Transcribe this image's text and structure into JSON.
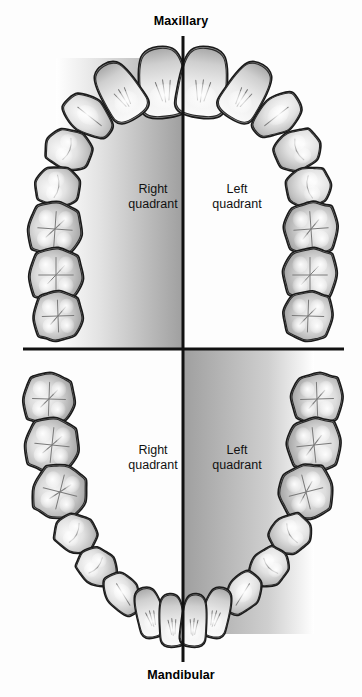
{
  "figure": {
    "background_color": "#fdfdfd",
    "axis_line_color": "#111111",
    "shading_color": "#a8a8a8"
  },
  "labels": {
    "maxillary": "Maxillary",
    "mandibular": "Mandibular",
    "upper_right": "Right\nquadrant",
    "upper_left": "Left\nquadrant",
    "lower_right": "Right\nquadrant",
    "lower_left": "Left\nquadrant",
    "quadrant_word_right": "Right",
    "quadrant_word_left": "Left",
    "quadrant_word_quadrant": "quadrant"
  },
  "quadrants": [
    {
      "id": "upper-right",
      "arch": "maxillary",
      "side": "right",
      "shaded": true,
      "label_line1": "Right",
      "label_line2": "quadrant"
    },
    {
      "id": "upper-left",
      "arch": "maxillary",
      "side": "left",
      "shaded": false,
      "label_line1": "Left",
      "label_line2": "quadrant"
    },
    {
      "id": "lower-right",
      "arch": "mandibular",
      "side": "right",
      "shaded": false,
      "label_line1": "Right",
      "label_line2": "quadrant"
    },
    {
      "id": "lower-left",
      "arch": "mandibular",
      "side": "left",
      "shaded": true,
      "label_line1": "Left",
      "label_line2": "quadrant"
    }
  ],
  "axes": {
    "vertical_line": {
      "x": 183,
      "y1": 36,
      "y2": 662,
      "width": 3
    },
    "horizontal_line": {
      "y": 349,
      "x1": 23,
      "x2": 344,
      "width": 3
    }
  },
  "teeth": {
    "maxillary_right": [
      {
        "name": "central-incisor",
        "cx": 163,
        "cy": 83,
        "rx": 25,
        "ry": 32,
        "rot": -8,
        "type": "incisor"
      },
      {
        "name": "lateral-incisor",
        "cx": 120,
        "cy": 92,
        "rx": 20,
        "ry": 28,
        "rot": -32,
        "type": "incisor"
      },
      {
        "name": "canine",
        "cx": 89,
        "cy": 116,
        "rx": 19,
        "ry": 26,
        "rot": -52,
        "type": "canine"
      },
      {
        "name": "first-premolar",
        "cx": 69,
        "cy": 150,
        "rx": 20,
        "ry": 22,
        "rot": -68,
        "type": "premolar"
      },
      {
        "name": "second-premolar",
        "cx": 58,
        "cy": 187,
        "rx": 20,
        "ry": 21,
        "rot": -80,
        "type": "premolar"
      },
      {
        "name": "first-molar",
        "cx": 55,
        "cy": 229,
        "rx": 25,
        "ry": 24,
        "rot": -86,
        "type": "molar"
      },
      {
        "name": "second-molar",
        "cx": 56,
        "cy": 275,
        "rx": 25,
        "ry": 24,
        "rot": -90,
        "type": "molar"
      },
      {
        "name": "third-molar",
        "cx": 58,
        "cy": 316,
        "rx": 23,
        "ry": 22,
        "rot": -92,
        "type": "molar"
      }
    ],
    "maxillary_left": [
      {
        "name": "central-incisor",
        "cx": 203,
        "cy": 83,
        "rx": 25,
        "ry": 32,
        "rot": 8,
        "type": "incisor"
      },
      {
        "name": "lateral-incisor",
        "cx": 246,
        "cy": 92,
        "rx": 20,
        "ry": 28,
        "rot": 32,
        "type": "incisor"
      },
      {
        "name": "canine",
        "cx": 277,
        "cy": 116,
        "rx": 19,
        "ry": 26,
        "rot": 52,
        "type": "canine"
      },
      {
        "name": "first-premolar",
        "cx": 297,
        "cy": 150,
        "rx": 20,
        "ry": 22,
        "rot": 68,
        "type": "premolar"
      },
      {
        "name": "second-premolar",
        "cx": 308,
        "cy": 187,
        "rx": 20,
        "ry": 21,
        "rot": 80,
        "type": "premolar"
      },
      {
        "name": "first-molar",
        "cx": 311,
        "cy": 229,
        "rx": 25,
        "ry": 24,
        "rot": 86,
        "type": "molar"
      },
      {
        "name": "second-molar",
        "cx": 310,
        "cy": 275,
        "rx": 25,
        "ry": 24,
        "rot": 90,
        "type": "molar"
      },
      {
        "name": "third-molar",
        "cx": 308,
        "cy": 316,
        "rx": 23,
        "ry": 22,
        "rot": 92,
        "type": "molar"
      }
    ],
    "mandibular_right": [
      {
        "name": "third-molar",
        "cx": 49,
        "cy": 399,
        "rx": 24,
        "ry": 23,
        "rot": -88,
        "type": "molar"
      },
      {
        "name": "second-molar",
        "cx": 52,
        "cy": 445,
        "rx": 25,
        "ry": 24,
        "rot": -84,
        "type": "molar"
      },
      {
        "name": "first-molar",
        "cx": 60,
        "cy": 492,
        "rx": 25,
        "ry": 24,
        "rot": -76,
        "type": "molar"
      },
      {
        "name": "second-premolar",
        "cx": 76,
        "cy": 534,
        "rx": 19,
        "ry": 20,
        "rot": -62,
        "type": "premolar"
      },
      {
        "name": "first-premolar",
        "cx": 97,
        "cy": 567,
        "rx": 18,
        "ry": 19,
        "rot": -48,
        "type": "premolar"
      },
      {
        "name": "canine",
        "cx": 123,
        "cy": 594,
        "rx": 17,
        "ry": 22,
        "rot": -32,
        "type": "canine"
      },
      {
        "name": "lateral-incisor",
        "cx": 150,
        "cy": 613,
        "rx": 14,
        "ry": 23,
        "rot": -16,
        "type": "incisor"
      },
      {
        "name": "central-incisor",
        "cx": 172,
        "cy": 621,
        "rx": 13,
        "ry": 24,
        "rot": -5,
        "type": "incisor"
      }
    ],
    "mandibular_left": [
      {
        "name": "third-molar",
        "cx": 317,
        "cy": 399,
        "rx": 24,
        "ry": 23,
        "rot": 88,
        "type": "molar"
      },
      {
        "name": "second-molar",
        "cx": 314,
        "cy": 445,
        "rx": 25,
        "ry": 24,
        "rot": 84,
        "type": "molar"
      },
      {
        "name": "first-molar",
        "cx": 306,
        "cy": 492,
        "rx": 25,
        "ry": 24,
        "rot": 76,
        "type": "molar"
      },
      {
        "name": "second-premolar",
        "cx": 290,
        "cy": 534,
        "rx": 19,
        "ry": 20,
        "rot": 62,
        "type": "premolar"
      },
      {
        "name": "first-premolar",
        "cx": 269,
        "cy": 567,
        "rx": 18,
        "ry": 19,
        "rot": 48,
        "type": "premolar"
      },
      {
        "name": "canine",
        "cx": 243,
        "cy": 594,
        "rx": 17,
        "ry": 22,
        "rot": 32,
        "type": "canine"
      },
      {
        "name": "lateral-incisor",
        "cx": 216,
        "cy": 613,
        "rx": 14,
        "ry": 23,
        "rot": 16,
        "type": "incisor"
      },
      {
        "name": "central-incisor",
        "cx": 194,
        "cy": 621,
        "rx": 13,
        "ry": 24,
        "rot": 5,
        "type": "incisor"
      }
    ]
  }
}
